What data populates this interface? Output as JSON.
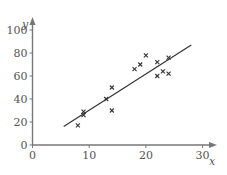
{
  "chart_data": {
    "type": "scatter",
    "title": "",
    "xlabel": "x",
    "ylabel": "y",
    "xlim": [
      0,
      32
    ],
    "ylim": [
      0,
      105
    ],
    "x_ticks": [
      0,
      10,
      20,
      30
    ],
    "y_ticks": [
      0,
      20,
      40,
      60,
      80,
      100
    ],
    "grid": false,
    "legend": null,
    "marker": "x",
    "points": [
      {
        "x": 8,
        "y": 17
      },
      {
        "x": 9,
        "y": 29
      },
      {
        "x": 9,
        "y": 26
      },
      {
        "x": 13,
        "y": 40
      },
      {
        "x": 14,
        "y": 50
      },
      {
        "x": 14,
        "y": 30
      },
      {
        "x": 18,
        "y": 66
      },
      {
        "x": 19,
        "y": 70
      },
      {
        "x": 20,
        "y": 78
      },
      {
        "x": 22,
        "y": 72
      },
      {
        "x": 22,
        "y": 60
      },
      {
        "x": 23,
        "y": 64
      },
      {
        "x": 24,
        "y": 76
      },
      {
        "x": 24,
        "y": 62
      }
    ],
    "regression_line": {
      "x1": 5.5,
      "y1": 16,
      "x2": 28,
      "y2": 87
    }
  },
  "colors": {
    "axis": "#777777",
    "marker": "#333333",
    "line": "#333333",
    "text": "#555555"
  }
}
